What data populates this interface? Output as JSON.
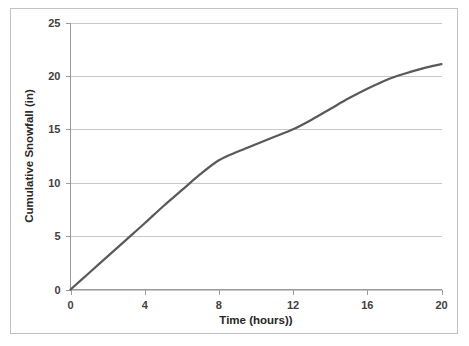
{
  "chart_data": {
    "type": "line",
    "title": "",
    "xlabel": "Time (hours))",
    "ylabel": "Cumulative Snowfall (in)",
    "xlim": [
      0,
      20
    ],
    "ylim": [
      0,
      25
    ],
    "xticks": [
      "0",
      "4",
      "8",
      "12",
      "16",
      "20"
    ],
    "xtick_values": [
      0,
      4,
      8,
      12,
      16,
      20
    ],
    "yticks": [
      "0",
      "5",
      "10",
      "15",
      "20",
      "25"
    ],
    "ytick_values": [
      0,
      5,
      10,
      15,
      20,
      25
    ],
    "grid": "horizontal",
    "legend": "none",
    "series": [
      {
        "name": "Cumulative Snowfall",
        "color": "#595959",
        "x": [
          0,
          1,
          2,
          3,
          4,
          5,
          6,
          7,
          8,
          9,
          10,
          11,
          12,
          13,
          14,
          15,
          16,
          17,
          18,
          19,
          20
        ],
        "values": [
          0,
          1.55,
          3.1,
          4.65,
          6.2,
          7.8,
          9.3,
          10.8,
          12.1,
          12.9,
          13.6,
          14.3,
          15.0,
          15.9,
          16.9,
          17.9,
          18.8,
          19.6,
          20.2,
          20.7,
          21.1
        ]
      }
    ]
  },
  "figure": {
    "border_color": "#c2c2c2",
    "background": "#ffffff",
    "gridline_color": "#c8c8c8",
    "axis_color": "#9a9a9a"
  }
}
